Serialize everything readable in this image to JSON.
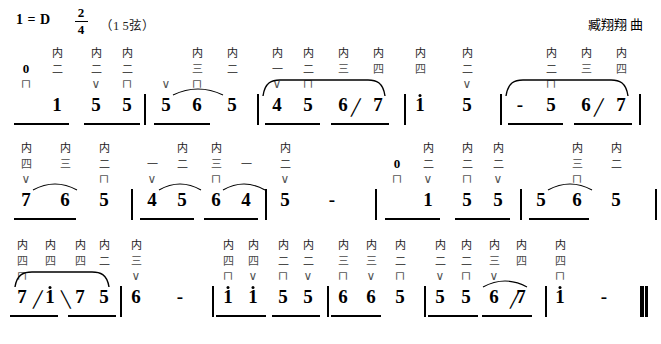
{
  "header": {
    "key_signature": "1 = D",
    "meter_numerator": "2",
    "meter_denominator": "4",
    "tuning": "（1  5弦）",
    "composer": "臧翔翔  曲"
  },
  "symbols": {
    "inner_string": "内",
    "string_1": "一",
    "string_2": "二",
    "string_3": "三",
    "string_4": "四",
    "bow_down": "⊓",
    "bow_up": "∨",
    "rest": "0",
    "hold_dash": "-",
    "slide_up": "╱",
    "slide_down": "╲",
    "barline": "|",
    "final_barline": "‖"
  },
  "chart_data": {
    "type": "table",
    "columns": [
      "note",
      "inner",
      "string",
      "bow"
    ],
    "lines": [
      {
        "index": 1,
        "measures": [
          {
            "notes": [
              {
                "note": "0",
                "inner": "",
                "string": "",
                "bow": "⊓"
              },
              {
                "note": "1",
                "inner": "内",
                "string": "二",
                "bow": ""
              },
              {
                "note": "5",
                "inner": "内",
                "string": "二",
                "bow": "∨"
              },
              {
                "note": "5",
                "inner": "内",
                "string": "二",
                "bow": "⊓"
              },
              {
                "note": "5",
                "inner": "",
                "string": "",
                "bow": "∨"
              }
            ]
          },
          {
            "notes": [
              {
                "note": "6",
                "inner": "内",
                "string": "三",
                "bow": "⊓"
              },
              {
                "note": "5",
                "inner": "内",
                "string": "二",
                "bow": ""
              },
              {
                "note": "4",
                "inner": "内",
                "string": "一",
                "bow": "∨"
              }
            ]
          },
          {
            "notes": [
              {
                "note": "5",
                "inner": "内",
                "string": "二",
                "bow": "⊓"
              },
              {
                "note": "6",
                "inner": "内",
                "string": "三",
                "bow": ""
              },
              {
                "note": "7",
                "inner": "内",
                "string": "四",
                "bow": "",
                "slide": "up"
              },
              {
                "note": "1̇",
                "inner": "内",
                "string": "四",
                "bow": ""
              }
            ]
          },
          {
            "notes": [
              {
                "note": "5",
                "inner": "内",
                "string": "二",
                "bow": "∨"
              },
              {
                "note": "-",
                "inner": "",
                "string": "",
                "bow": ""
              }
            ]
          },
          {
            "notes": [
              {
                "note": "5",
                "inner": "内",
                "string": "二",
                "bow": "⊓"
              },
              {
                "note": "6",
                "inner": "内",
                "string": "三",
                "bow": ""
              },
              {
                "note": "7",
                "inner": "内",
                "string": "四",
                "bow": "",
                "slide": "up"
              },
              {
                "note": "1̇",
                "inner": "内",
                "string": "四",
                "bow": ""
              }
            ]
          }
        ]
      },
      {
        "index": 2,
        "measures": [
          {
            "notes": [
              {
                "note": "7",
                "inner": "内",
                "string": "四",
                "bow": "∨"
              },
              {
                "note": "6",
                "inner": "内",
                "string": "三",
                "bow": ""
              },
              {
                "note": "5",
                "inner": "内",
                "string": "二",
                "bow": "⊓"
              }
            ]
          },
          {
            "notes": [
              {
                "note": "4",
                "inner": "",
                "string": "一",
                "bow": "∨"
              },
              {
                "note": "5",
                "inner": "内",
                "string": "二",
                "bow": ""
              },
              {
                "note": "6",
                "inner": "内",
                "string": "三",
                "bow": "⊓"
              },
              {
                "note": "4",
                "inner": "",
                "string": "一",
                "bow": ""
              }
            ]
          },
          {
            "notes": [
              {
                "note": "5",
                "inner": "内",
                "string": "二",
                "bow": "∨"
              },
              {
                "note": "-",
                "inner": "",
                "string": "",
                "bow": ""
              }
            ]
          },
          {
            "notes": [
              {
                "note": "0",
                "inner": "",
                "string": "",
                "bow": "⊓"
              },
              {
                "note": "1",
                "inner": "内",
                "string": "二",
                "bow": "∨"
              },
              {
                "note": "5",
                "inner": "内",
                "string": "二",
                "bow": "⊓"
              },
              {
                "note": "5",
                "inner": "内",
                "string": "二",
                "bow": "∨"
              },
              {
                "note": "5",
                "inner": "",
                "string": "",
                "bow": ""
              }
            ]
          },
          {
            "notes": [
              {
                "note": "6",
                "inner": "内",
                "string": "三",
                "bow": "⊓"
              },
              {
                "note": "5",
                "inner": "内",
                "string": "二",
                "bow": ""
              },
              {
                "note": "4",
                "inner": "",
                "string": "一",
                "bow": "∨"
              }
            ]
          }
        ]
      },
      {
        "index": 3,
        "measures": [
          {
            "notes": [
              {
                "note": "7",
                "inner": "内",
                "string": "四",
                "bow": "⊓",
                "slide": "up"
              },
              {
                "note": "1̇",
                "inner": "内",
                "string": "四",
                "bow": "",
                "slide": "down"
              },
              {
                "note": "7",
                "inner": "内",
                "string": "四",
                "bow": ""
              },
              {
                "note": "5",
                "inner": "内",
                "string": "二",
                "bow": ""
              }
            ]
          },
          {
            "notes": [
              {
                "note": "6",
                "inner": "内",
                "string": "三",
                "bow": "∨"
              },
              {
                "note": "-",
                "inner": "",
                "string": "",
                "bow": ""
              }
            ]
          },
          {
            "notes": [
              {
                "note": "1̇",
                "inner": "内",
                "string": "四",
                "bow": "⊓"
              },
              {
                "note": "1̇",
                "inner": "内",
                "string": "四",
                "bow": "∨"
              },
              {
                "note": "5",
                "inner": "内",
                "string": "二",
                "bow": "⊓"
              },
              {
                "note": "5",
                "inner": "内",
                "string": "二",
                "bow": "∨"
              }
            ]
          },
          {
            "notes": [
              {
                "note": "6",
                "inner": "内",
                "string": "三",
                "bow": "⊓"
              },
              {
                "note": "6",
                "inner": "内",
                "string": "三",
                "bow": "∨"
              },
              {
                "note": "5",
                "inner": "内",
                "string": "二",
                "bow": "⊓"
              }
            ]
          },
          {
            "notes": [
              {
                "note": "5",
                "inner": "内",
                "string": "二",
                "bow": "∨"
              },
              {
                "note": "5",
                "inner": "内",
                "string": "二",
                "bow": "⊓"
              },
              {
                "note": "6",
                "inner": "内",
                "string": "三",
                "bow": "∨"
              },
              {
                "note": "7",
                "inner": "内",
                "string": "四",
                "bow": "",
                "slide": "up"
              }
            ]
          },
          {
            "notes": [
              {
                "note": "1̇",
                "inner": "内",
                "string": "四",
                "bow": "⊓"
              },
              {
                "note": "-",
                "inner": "",
                "string": "",
                "bow": ""
              }
            ]
          }
        ]
      }
    ]
  }
}
